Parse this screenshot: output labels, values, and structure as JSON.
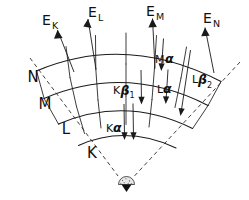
{
  "figure": {
    "background_color": "#ffffff",
    "stroke_color": "#1a1a1a",
    "width": 249,
    "height": 200
  },
  "nucleus": {
    "name": "nucleus",
    "fill_color": "#e8e8e8",
    "outline_color": "#2a2a2a"
  },
  "shells": [
    {
      "id": "K",
      "label": "K",
      "order": 1,
      "radius": 62
    },
    {
      "id": "L",
      "label": "L",
      "order": 2,
      "radius": 87
    },
    {
      "id": "M",
      "label": "M",
      "order": 3,
      "radius": 112
    },
    {
      "id": "N",
      "label": "N",
      "order": 4,
      "radius": 137
    }
  ],
  "energy_rays": [
    {
      "id": "EK",
      "base": "E",
      "sub": "K",
      "label": "EK"
    },
    {
      "id": "EL",
      "base": "E",
      "sub": "L",
      "label": "EL"
    },
    {
      "id": "EM",
      "base": "E",
      "sub": "M",
      "label": "EM"
    },
    {
      "id": "EN",
      "base": "E",
      "sub": "N",
      "label": "EN"
    }
  ],
  "transitions": [
    {
      "id": "K-alpha",
      "prefix": "K",
      "greek": "α",
      "sub": "",
      "label": "Kα",
      "from_shell": "L",
      "to_shell": "K"
    },
    {
      "id": "K-beta-1",
      "prefix": "K",
      "greek": "β",
      "sub": "1",
      "label": "Kβ1",
      "from_shell": "M",
      "to_shell": "K"
    },
    {
      "id": "L-alpha",
      "prefix": "L",
      "greek": "α",
      "sub": "",
      "label": "Lα",
      "from_shell": "M",
      "to_shell": "L"
    },
    {
      "id": "M-alpha",
      "prefix": "M",
      "greek": "α",
      "sub": "",
      "label": "Mα",
      "from_shell": "N",
      "to_shell": "M"
    },
    {
      "id": "L-beta-2",
      "prefix": "L",
      "greek": "β",
      "sub": "2",
      "label": "Lβ2",
      "from_shell": "N",
      "to_shell": "L"
    }
  ]
}
